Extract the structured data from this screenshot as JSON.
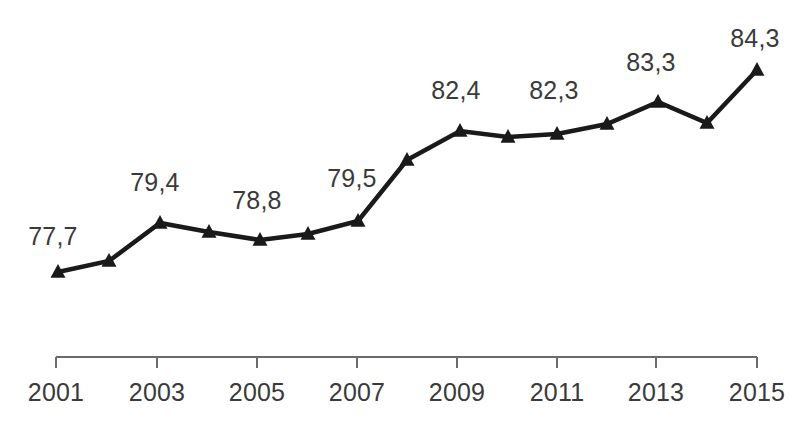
{
  "chart_data": {
    "type": "line",
    "title": "",
    "subtitle": "",
    "xlabel": "",
    "ylabel": "",
    "grid": false,
    "legend": null,
    "decimal_separator": ",",
    "marker": "triangle",
    "line_color": "#1a1a1a",
    "label_color": "#3a3a3a",
    "axis_color": "#6b6b6b",
    "x": [
      2001,
      2002,
      2003,
      2004,
      2005,
      2006,
      2007,
      2008,
      2009,
      2010,
      2011,
      2012,
      2013,
      2014,
      2015
    ],
    "values": [
      77.7,
      78.1,
      79.4,
      79.1,
      78.8,
      79.0,
      79.5,
      81.4,
      82.4,
      82.3,
      82.3,
      82.7,
      83.3,
      82.7,
      84.3
    ],
    "ylim": [
      76.6,
      85.3
    ],
    "xlim": [
      2001,
      2015
    ],
    "axis_tick_years": [
      2001,
      2003,
      2005,
      2007,
      2009,
      2011,
      2013,
      2015
    ],
    "axis_tick_labels": [
      "2001",
      "2003",
      "2005",
      "2007",
      "2009",
      "2011",
      "2013",
      "2015"
    ],
    "points": [
      {
        "year": 2001,
        "value": 77.7,
        "label": "77,7",
        "px": 58,
        "py": 272,
        "label_x": 53,
        "label_y": 236
      },
      {
        "year": 2002,
        "value": 78.1,
        "label": null,
        "px": 109,
        "py": 261,
        "label_x": null,
        "label_y": null
      },
      {
        "year": 2003,
        "value": 79.4,
        "label": "79,4",
        "px": 160,
        "py": 223,
        "label_x": 155,
        "label_y": 182
      },
      {
        "year": 2004,
        "value": 79.1,
        "label": null,
        "px": 209,
        "py": 232,
        "label_x": null,
        "label_y": null
      },
      {
        "year": 2005,
        "value": 78.8,
        "label": "78,8",
        "px": 260,
        "py": 240,
        "label_x": 257,
        "label_y": 200
      },
      {
        "year": 2006,
        "value": 79.0,
        "label": null,
        "px": 308,
        "py": 234,
        "label_x": null,
        "label_y": null
      },
      {
        "year": 2007,
        "value": 79.5,
        "label": "79,5",
        "px": 358,
        "py": 221,
        "label_x": 352,
        "label_y": 178
      },
      {
        "year": 2008,
        "value": 81.4,
        "label": null,
        "px": 407,
        "py": 160,
        "label_x": null,
        "label_y": null
      },
      {
        "year": 2009,
        "value": 82.4,
        "label": "82,4",
        "px": 460,
        "py": 131,
        "label_x": 456,
        "label_y": 90
      },
      {
        "year": 2010,
        "value": 82.3,
        "label": null,
        "px": 508,
        "py": 137,
        "label_x": null,
        "label_y": null
      },
      {
        "year": 2011,
        "value": 82.3,
        "label": "82,3",
        "px": 557,
        "py": 134,
        "label_x": 554,
        "label_y": 90
      },
      {
        "year": 2012,
        "value": 82.7,
        "label": null,
        "px": 607,
        "py": 124,
        "label_x": null,
        "label_y": null
      },
      {
        "year": 2013,
        "value": 83.3,
        "label": "83,3",
        "px": 658,
        "py": 102,
        "label_x": 651,
        "label_y": 62
      },
      {
        "year": 2014,
        "value": 82.7,
        "label": null,
        "px": 707,
        "py": 123,
        "label_x": null,
        "label_y": null
      },
      {
        "year": 2015,
        "value": 84.3,
        "label": "84,3",
        "px": 757,
        "py": 70,
        "label_x": 755,
        "label_y": 38
      }
    ],
    "axis": {
      "y": 357,
      "x_start": 56,
      "x_end": 757,
      "tick_length": 11,
      "tick_positions": [
        56,
        157,
        257,
        357,
        457,
        557,
        656,
        757
      ],
      "label_y": 378
    }
  }
}
